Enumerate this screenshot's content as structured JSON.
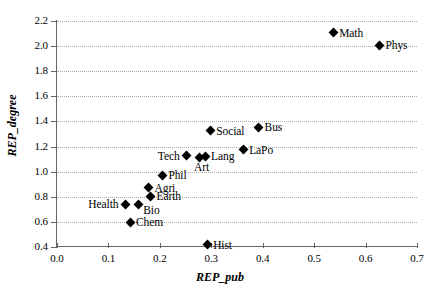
{
  "chart_data": {
    "type": "scatter",
    "title": "",
    "xlabel": "REP_pub",
    "ylabel": "REP_degree",
    "xlim": [
      0.0,
      0.7
    ],
    "ylim": [
      0.4,
      2.2
    ],
    "grid": true,
    "legend": "none",
    "xticks": [
      "0.0",
      "0.1",
      "0.2",
      "0.3",
      "0.4",
      "0.5",
      "0.6",
      "0.7"
    ],
    "yticks": [
      "0.4",
      "0.6",
      "0.8",
      "1.0",
      "1.2",
      "1.4",
      "1.6",
      "1.8",
      "2.0",
      "2.2"
    ],
    "marker_color": "#000000",
    "grid_color": "#aaaaaa",
    "axis_color": "#666666",
    "points": [
      {
        "label": "Math",
        "x": 0.537,
        "y": 2.105,
        "label_pos": "right"
      },
      {
        "label": "Phys",
        "x": 0.627,
        "y": 2.005,
        "label_pos": "right"
      },
      {
        "label": "Bus",
        "x": 0.392,
        "y": 1.352,
        "label_pos": "right"
      },
      {
        "label": "Social",
        "x": 0.298,
        "y": 1.325,
        "label_pos": "right"
      },
      {
        "label": "LaPo",
        "x": 0.362,
        "y": 1.175,
        "label_pos": "right"
      },
      {
        "label": "Tech",
        "x": 0.252,
        "y": 1.128,
        "label_pos": "left"
      },
      {
        "label": "Lang",
        "x": 0.288,
        "y": 1.122,
        "label_pos": "right"
      },
      {
        "label": "Art",
        "x": 0.278,
        "y": 1.115,
        "label_pos": "below"
      },
      {
        "label": "Phil",
        "x": 0.205,
        "y": 0.97,
        "label_pos": "right"
      },
      {
        "label": "Agri",
        "x": 0.178,
        "y": 0.872,
        "label_pos": "right"
      },
      {
        "label": "Earth",
        "x": 0.182,
        "y": 0.805,
        "label_pos": "right"
      },
      {
        "label": "Bio",
        "x": 0.158,
        "y": 0.742,
        "label_pos": "belowright"
      },
      {
        "label": "Health",
        "x": 0.133,
        "y": 0.74,
        "label_pos": "left"
      },
      {
        "label": "Chem",
        "x": 0.142,
        "y": 0.597,
        "label_pos": "right"
      },
      {
        "label": "Hist",
        "x": 0.292,
        "y": 0.418,
        "label_pos": "right"
      }
    ]
  }
}
